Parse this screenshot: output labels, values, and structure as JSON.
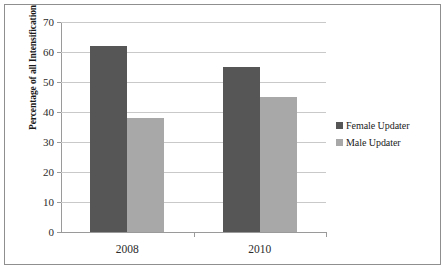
{
  "chart_data": {
    "type": "bar",
    "title": "",
    "xlabel": "",
    "ylabel": "Percentage of all Intensification",
    "categories": [
      "2008",
      "2010"
    ],
    "series": [
      {
        "name": "Female Updater",
        "color": "#565656",
        "values": [
          62,
          55
        ]
      },
      {
        "name": "Male Updater",
        "color": "#a8a8a8",
        "values": [
          38,
          45
        ]
      }
    ],
    "ylim": [
      0,
      70
    ],
    "yticks": [
      70,
      60,
      50,
      40,
      30,
      20,
      10,
      0
    ],
    "ytick_labels": [
      "70",
      "60",
      "50",
      "40",
      "30",
      "20",
      "10",
      "0"
    ],
    "grid": true,
    "legend_position": "right"
  },
  "legend": {
    "items": [
      {
        "label": "Female Updater"
      },
      {
        "label": "Male Updater"
      }
    ]
  }
}
